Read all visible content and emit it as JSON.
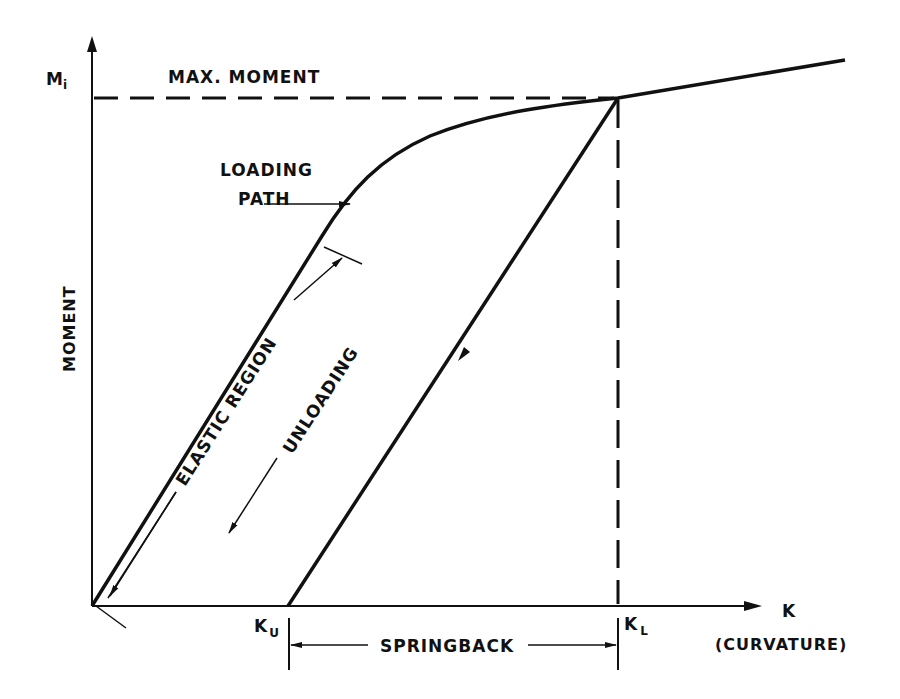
{
  "diagram": {
    "y_axis": {
      "label": "MOMENT",
      "tick_label": "M",
      "tick_subscript": "i"
    },
    "x_axis": {
      "label": "K",
      "sublabel": "(CURVATURE)"
    },
    "labels": {
      "max_moment": "MAX. MOMENT",
      "loading_path_line1": "LOADING",
      "loading_path_line2": "PATH",
      "elastic_region": "ELASTIC REGION",
      "unloading": "UNLOADING",
      "springback": "SPRINGBACK",
      "k_u_main": "K",
      "k_u_sub": "U",
      "k_l_main": "K",
      "k_l_sub": "L"
    },
    "colors": {
      "ink": "#111111",
      "background": "#ffffff"
    }
  }
}
